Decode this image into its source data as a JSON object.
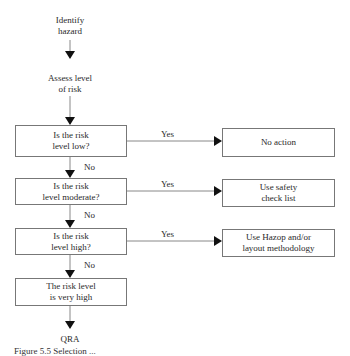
{
  "flowchart": {
    "start": {
      "line1": "Identify",
      "line2": "hazard"
    },
    "assess": {
      "line1": "Assess level",
      "line2": "of risk"
    },
    "decisions": [
      {
        "line1": "Is the risk",
        "line2": "level low?",
        "yes_label": "Yes",
        "no_label": "No",
        "action": {
          "line1": "No action",
          "line2": ""
        }
      },
      {
        "line1": "Is the risk",
        "line2": "level moderate?",
        "yes_label": "Yes",
        "no_label": "No",
        "action": {
          "line1": "Use safety",
          "line2": "check list"
        }
      },
      {
        "line1": "Is the risk",
        "line2": "level high?",
        "yes_label": "Yes",
        "no_label": "No",
        "action": {
          "line1": "Use Hazop and/or",
          "line2": "layout methodology"
        }
      }
    ],
    "final_box": {
      "line1": "The risk level",
      "line2": "is very high"
    },
    "end": "QRA"
  },
  "caption": "Figure 5.5   Selection ..."
}
